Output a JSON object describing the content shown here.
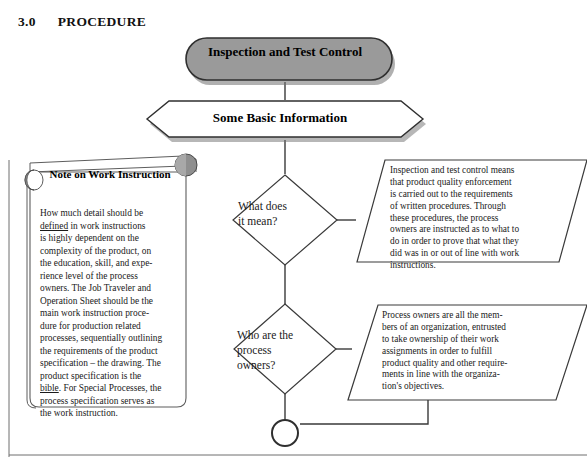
{
  "heading": {
    "number": "3.0",
    "title": "PROCEDURE"
  },
  "colors": {
    "title_fill": "#9a9a9a",
    "shape_stroke": "#3a3a3a",
    "note_curl_fill": "#8f8f8f",
    "text": "#1a1a1a",
    "page_background": "#ffffff"
  },
  "flowchart": {
    "title_box": {
      "shape": "rounded-rectangle",
      "label": "Inspection and Test Control"
    },
    "hexagon": {
      "shape": "hexagon",
      "label": "Some Basic Information"
    },
    "decision_1": {
      "shape": "diamond",
      "lines": [
        "What does",
        "it mean?"
      ]
    },
    "decision_2": {
      "shape": "diamond",
      "lines": [
        "Who are the",
        "process",
        "owners?"
      ]
    },
    "answer_1": {
      "shape": "parallelogram",
      "lines": [
        "Inspection and test control means",
        "that product quality enforcement",
        "is carried out to the requirements",
        "of written procedures. Through",
        "these procedures, the process",
        "owners are instructed as to what to",
        "do in order to prove that what they",
        "did was in or out of line with work",
        "instructions."
      ]
    },
    "answer_2": {
      "shape": "parallelogram",
      "lines": [
        "Process owners are all the mem-",
        "bers of an organization, entrusted",
        "to take ownership of their work",
        "assignments in order to fulfill",
        "product quality and other require-",
        "ments in line with the organiza-",
        "tion's objectives."
      ]
    },
    "connector_circle": {
      "shape": "circle",
      "label": ""
    }
  },
  "note": {
    "shape": "scroll-banner",
    "title": "Note on Work Instruction",
    "paragraph_segments": [
      {
        "text": "How much detail should be ",
        "underline": false
      },
      {
        "text": "defined",
        "underline": true
      },
      {
        "text": " in work instructions is highly dependent on the complexity of the product, on the education, skill, and experience level of the process owners. The Job Traveler and Operation Sheet should be the main work instruction procedure for production related processes, sequentially outlining the requirements of the product specification – the drawing. The product specification is the ",
        "underline": false
      },
      {
        "text": "bible",
        "underline": true
      },
      {
        "text": ". For Special Processes, the process specification serves as the work instruction.",
        "underline": false
      }
    ],
    "lines": [
      "How much detail should be",
      "defined in work instructions",
      "is highly dependent on the",
      "complexity of the product, on",
      "the education, skill, and expe-",
      "rience level of the process",
      "owners. The Job Traveler and",
      "Operation Sheet should be the",
      "main work instruction proce-",
      "dure for production related",
      "processes, sequentially outlining",
      "the requirements of the product",
      "specification – the drawing. The",
      "product specification is the",
      "bible. For Special Processes, the",
      "process specification serves as",
      "the work instruction."
    ]
  }
}
